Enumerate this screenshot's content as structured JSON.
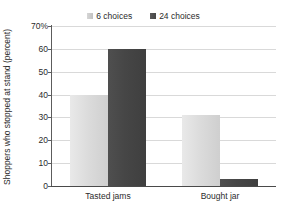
{
  "chart_data": {
    "type": "bar",
    "title": "",
    "xlabel": "",
    "ylabel": "Shoppers who stopped at stand (percent)",
    "categories": [
      "Tasted jams",
      "Bought jar"
    ],
    "series": [
      {
        "name": "6 choices",
        "values": [
          40,
          31
        ],
        "color": "#d9d9d9"
      },
      {
        "name": "24 choices",
        "values": [
          60,
          3
        ],
        "color": "#474747"
      }
    ],
    "ylim": [
      0,
      70
    ],
    "ytick_values": [
      0,
      10,
      20,
      30,
      40,
      50,
      60,
      70
    ],
    "ytick_labels": [
      "0",
      "10",
      "20",
      "30",
      "40",
      "50",
      "60",
      "70%"
    ],
    "grid": true,
    "grid_axis": "y",
    "legend_position": "top-center",
    "grid_color": "#d9d9d9",
    "axis_color": "#4a4a4a",
    "text_color": "#2b2b2b"
  },
  "legend": {
    "entries": [
      {
        "label": "6 choices",
        "swatch": "light"
      },
      {
        "label": "24 choices",
        "swatch": "dark"
      }
    ]
  },
  "axes": {
    "y_title": "Shoppers who stopped at stand (percent)",
    "y_ticks": [
      "70%",
      "60",
      "50",
      "40",
      "30",
      "20",
      "10",
      "0"
    ],
    "x_ticks": [
      "Tasted jams",
      "Bought jar"
    ]
  }
}
